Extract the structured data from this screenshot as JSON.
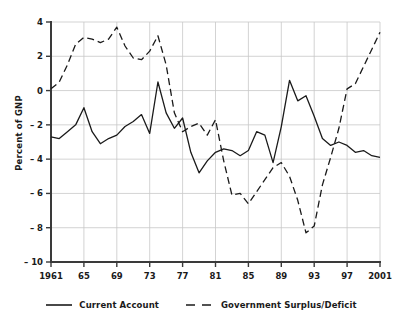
{
  "chart_data": {
    "type": "line",
    "title": "",
    "subtitle": "",
    "xlabel": "",
    "ylabel": "Percent of GNP",
    "xlim": [
      1961,
      2001
    ],
    "ylim": [
      -10,
      4
    ],
    "ytick_values": [
      4,
      2,
      0,
      -2,
      -4,
      -6,
      -8,
      -10
    ],
    "ytick_labels": [
      "4",
      "2",
      "0",
      "– 2",
      "– 4",
      "– 6",
      "– 8",
      "– 10"
    ],
    "xtick_values": [
      1961,
      1965,
      1969,
      1973,
      1977,
      1981,
      1985,
      1989,
      1993,
      1997,
      2001
    ],
    "xtick_labels": [
      "1961",
      "65",
      "69",
      "73",
      "77",
      "81",
      "85",
      "89",
      "93",
      "97",
      "2001"
    ],
    "grid": true,
    "grid_color": "#c8c8c8",
    "axis_color": "#3a3a3a",
    "line_color": "#1a1a1a",
    "legend_position": "bottom",
    "series": [
      {
        "name": "Current Account",
        "style": "solid",
        "x": [
          1961,
          1962,
          1963,
          1964,
          1965,
          1966,
          1967,
          1968,
          1969,
          1970,
          1971,
          1972,
          1973,
          1974,
          1975,
          1976,
          1977,
          1978,
          1979,
          1980,
          1981,
          1982,
          1983,
          1984,
          1985,
          1986,
          1987,
          1988,
          1989,
          1990,
          1991,
          1992,
          1993,
          1994,
          1995,
          1996,
          1997,
          1998,
          1999,
          2000,
          2001
        ],
        "values": [
          -2.7,
          -2.8,
          -2.4,
          -2.0,
          -1.0,
          -2.4,
          -3.1,
          -2.8,
          -2.6,
          -2.1,
          -1.8,
          -1.4,
          -2.5,
          0.5,
          -1.3,
          -2.2,
          -1.6,
          -3.6,
          -4.8,
          -4.1,
          -3.6,
          -3.4,
          -3.5,
          -3.8,
          -3.5,
          -2.4,
          -2.6,
          -4.2,
          -2.1,
          0.6,
          -0.6,
          -0.3,
          -1.5,
          -2.8,
          -3.2,
          -3.0,
          -3.2,
          -3.6,
          -3.5,
          -3.8,
          -3.9
        ]
      },
      {
        "name": "Government Surplus/Deficit",
        "style": "dashed",
        "x": [
          1961,
          1962,
          1963,
          1964,
          1965,
          1966,
          1967,
          1968,
          1969,
          1970,
          1971,
          1972,
          1973,
          1974,
          1975,
          1976,
          1977,
          1978,
          1979,
          1980,
          1981,
          1982,
          1983,
          1984,
          1985,
          1986,
          1987,
          1988,
          1989,
          1990,
          1991,
          1992,
          1993,
          1994,
          1995,
          1996,
          1997,
          1998,
          1999,
          2000,
          2001
        ],
        "values": [
          0.1,
          0.5,
          1.5,
          2.7,
          3.1,
          3.0,
          2.8,
          3.0,
          3.7,
          2.6,
          1.9,
          1.8,
          2.3,
          3.2,
          1.5,
          -1.3,
          -2.4,
          -2.1,
          -1.9,
          -2.6,
          -1.7,
          -4.1,
          -6.1,
          -6.0,
          -6.6,
          -5.9,
          -5.2,
          -4.5,
          -4.2,
          -5.0,
          -6.4,
          -8.3,
          -7.9,
          -5.5,
          -3.9,
          -2.2,
          0.1,
          0.4,
          1.4,
          2.4,
          3.4
        ]
      }
    ],
    "right_segment_note": "current account rises sharply after 1993 to about 3.0 at 2000"
  },
  "axes": {
    "ylabel": "Percent of GNP"
  },
  "legend": {
    "items": [
      {
        "label": "Current Account",
        "style": "solid"
      },
      {
        "label": "Government Surplus/Deficit",
        "style": "dashed"
      }
    ]
  }
}
